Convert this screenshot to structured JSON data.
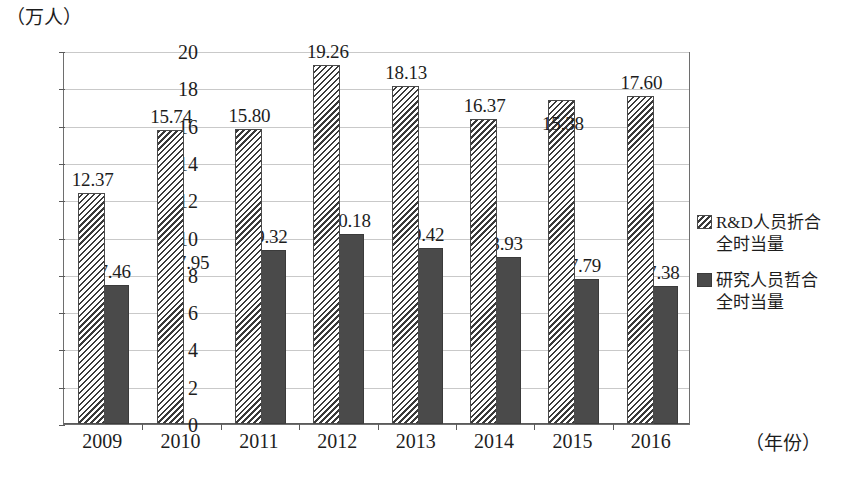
{
  "chart_data": {
    "type": "bar",
    "title": "",
    "subtitle": "",
    "xlabel": "（年份）",
    "ylabel": "（万人）",
    "ylim": [
      0,
      20
    ],
    "ytick_step": 2,
    "grid": true,
    "legend_position": "right",
    "categories": [
      "2009",
      "2010",
      "2011",
      "2012",
      "2013",
      "2014",
      "2015",
      "2016"
    ],
    "yticks": [
      "20",
      "18",
      "16",
      "14",
      "12",
      "10",
      "8",
      "6",
      "4",
      "2",
      "0"
    ],
    "series": [
      {
        "name": "R&D人员折合全时当量",
        "style": "hatch",
        "values": [
          12.37,
          15.74,
          15.8,
          19.26,
          18.13,
          16.37,
          15.38,
          17.6
        ],
        "labels": [
          "12.37",
          "15.74",
          "15.80",
          "19.26",
          "18.13",
          "16.37",
          "15.38",
          "17.60"
        ],
        "drawn_heights": [
          12.37,
          15.74,
          15.8,
          19.26,
          18.13,
          16.37,
          17.4,
          17.6
        ]
      },
      {
        "name": "研究人员哲合全时当量",
        "style": "solid",
        "values": [
          7.46,
          7.95,
          9.32,
          10.18,
          9.42,
          8.93,
          7.79,
          7.38
        ],
        "labels": [
          "7.46",
          "7.95",
          "9.32",
          "10.18",
          "9.42",
          "8.93",
          "7.79",
          "7.38"
        ],
        "drawn_heights": [
          7.46,
          0,
          9.32,
          10.18,
          9.42,
          8.93,
          7.79,
          7.38
        ]
      }
    ]
  },
  "legend": {
    "items": [
      {
        "swatch": "hatch-swatch",
        "line1": "R&D人员折合",
        "line2": "全时当量"
      },
      {
        "swatch": "solid-swatch",
        "line1": "研究人员哲合",
        "line2": "全时当量"
      }
    ]
  },
  "colors": {
    "series_hatch": "#3a3a3a",
    "series_solid": "#4a4a4a",
    "grid": "#c9c9c9",
    "axis": "#5a5a5a",
    "text": "#1d1d1d",
    "background": "#ffffff"
  }
}
